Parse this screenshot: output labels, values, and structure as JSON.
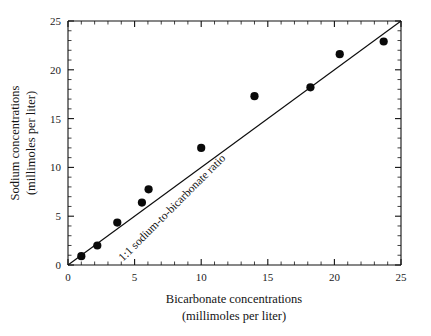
{
  "chart_data": {
    "type": "scatter",
    "title": "",
    "xlabel": "Bicarbonate concentrations (millimoles per liter)",
    "xlabel_line1": "Bicarbonate concentrations",
    "xlabel_line2": "(millimoles per liter)",
    "ylabel": "Sodium concentrations (millimoles per liter)",
    "ylabel_line1": "Sodium concentrations",
    "ylabel_line2": "(millimoles per liter)",
    "xlim": [
      0,
      25
    ],
    "ylim": [
      0,
      25
    ],
    "xticks": [
      0,
      5,
      10,
      15,
      20,
      25
    ],
    "yticks": [
      0,
      5,
      10,
      15,
      20,
      25
    ],
    "xtick_labels": [
      "0",
      "5",
      "10",
      "15",
      "20",
      "25"
    ],
    "ytick_labels": [
      "0",
      "5",
      "10",
      "15",
      "20",
      "25"
    ],
    "minor_tick_interval": 1,
    "grid": false,
    "legend": false,
    "marker_color": "#0a0a0a",
    "line_color": "#0d0d0d",
    "points": [
      {
        "x": 1.0,
        "y": 0.9
      },
      {
        "x": 2.2,
        "y": 2.0
      },
      {
        "x": 3.7,
        "y": 4.35
      },
      {
        "x": 5.55,
        "y": 6.4
      },
      {
        "x": 6.05,
        "y": 7.75
      },
      {
        "x": 10.0,
        "y": 12.0
      },
      {
        "x": 14.0,
        "y": 17.3
      },
      {
        "x": 18.2,
        "y": 18.2
      },
      {
        "x": 20.4,
        "y": 21.6
      },
      {
        "x": 23.7,
        "y": 22.9
      }
    ],
    "reference_line": {
      "label": "1:1 sodium-to-bicarbonate ratio",
      "slope": 1,
      "intercept": 0,
      "from": [
        0,
        0
      ],
      "to": [
        25,
        25
      ]
    },
    "annotations": [
      {
        "text": "1:1 sodium-to-bicarbonate ratio",
        "x": 8.0,
        "y": 5.6,
        "rotation": -45
      }
    ]
  }
}
